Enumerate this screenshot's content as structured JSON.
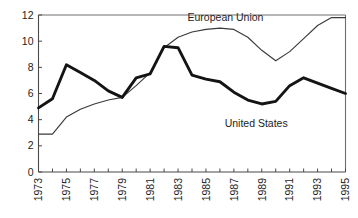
{
  "chart_data": {
    "type": "line",
    "title": "",
    "subtitle": "",
    "xlabel": "",
    "ylabel": "",
    "xlim": [
      1973,
      1995
    ],
    "ylim": [
      0,
      12
    ],
    "grid": false,
    "legend_position": "inline-annotations",
    "x": [
      1973,
      1974,
      1975,
      1976,
      1977,
      1978,
      1979,
      1980,
      1981,
      1982,
      1983,
      1984,
      1985,
      1986,
      1987,
      1988,
      1989,
      1990,
      1991,
      1992,
      1993,
      1994,
      1995
    ],
    "xticks": [
      1973,
      1974,
      1975,
      1976,
      1977,
      1978,
      1979,
      1980,
      1981,
      1982,
      1983,
      1984,
      1985,
      1986,
      1987,
      1988,
      1989,
      1990,
      1991,
      1992,
      1993,
      1994,
      1995
    ],
    "xticklabels": [
      "1973",
      "",
      "1975",
      "",
      "1977",
      "",
      "1979",
      "",
      "1981",
      "",
      "1983",
      "",
      "1985",
      "",
      "1987",
      "",
      "1989",
      "",
      "1991",
      "",
      "1993",
      "",
      "1995"
    ],
    "yticks": [
      0,
      2,
      4,
      6,
      8,
      10,
      12
    ],
    "yticklabels": [
      "0",
      "2",
      "4",
      "6",
      "8",
      "10",
      "12"
    ],
    "series": [
      {
        "name": "European Union",
        "color": "#3a3a3a",
        "linewidth": "thin",
        "annotation": "European Union",
        "values": [
          2.9,
          2.9,
          4.2,
          4.8,
          5.2,
          5.5,
          5.7,
          6.6,
          7.6,
          9.5,
          10.3,
          10.7,
          10.9,
          11.0,
          10.9,
          10.3,
          9.3,
          8.5,
          9.2,
          10.2,
          11.2,
          11.8,
          11.8
        ]
      },
      {
        "name": "United States",
        "color": "#141414",
        "linewidth": "thick",
        "annotation": "United States",
        "values": [
          4.9,
          5.6,
          8.2,
          7.6,
          7.0,
          6.2,
          5.7,
          7.2,
          7.5,
          9.6,
          9.5,
          7.4,
          7.1,
          6.9,
          6.1,
          5.5,
          5.2,
          5.4,
          6.6,
          7.2,
          6.8,
          6.4,
          6.0
        ]
      }
    ],
    "annotations": [
      {
        "text": "European Union",
        "x": 1986.4,
        "y": 11.55
      },
      {
        "text": "United States",
        "x": 1988.6,
        "y": 3.45
      }
    ]
  }
}
